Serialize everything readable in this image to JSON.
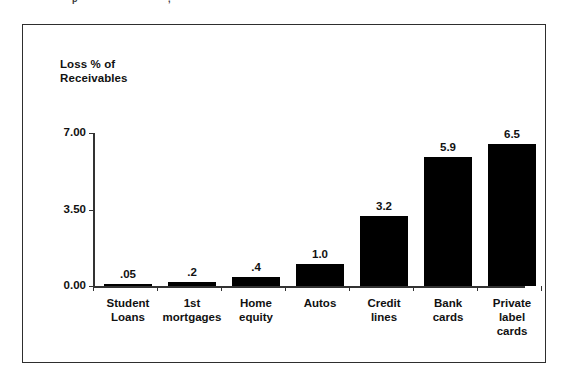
{
  "top_artifact": {
    "fragments": [
      {
        "text": "p",
        "x": 72
      },
      {
        "text": ",",
        "x": 168
      }
    ]
  },
  "chart_data": {
    "type": "bar",
    "title": "",
    "subtitle": "",
    "xlabel": "",
    "ylabel": "Loss % of\nReceivables",
    "categories": [
      "Student\nLoans",
      "1st\nmortgages",
      "Home\nequity",
      "Autos",
      "Credit\nlines",
      "Bank\ncards",
      "Private\nlabel\ncards"
    ],
    "values": [
      0.05,
      0.2,
      0.4,
      1.0,
      3.2,
      5.9,
      6.5
    ],
    "value_labels": [
      ".05",
      ".2",
      ".4",
      "1.0",
      "3.2",
      "5.9",
      "6.5"
    ],
    "ylim": [
      0,
      7
    ],
    "ytick_values": [
      0,
      3.5,
      7
    ],
    "ytick_labels": [
      "0.00",
      "3.50",
      "7.00"
    ],
    "grid": false,
    "legend": false,
    "bar_color": "#000000",
    "axis_color": "#333333",
    "frame_color": "#2e2e2e",
    "text_color": "#111111"
  }
}
